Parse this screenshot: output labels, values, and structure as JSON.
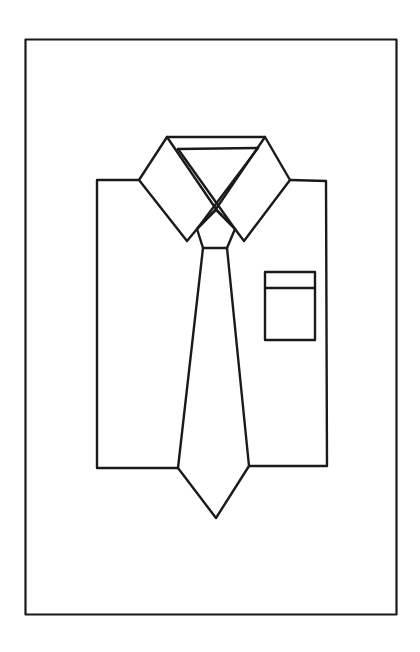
{
  "drawing": {
    "subject": "shirt-and-tie line drawing",
    "stroke_color": "#1a1a1a",
    "background": "#ffffff",
    "frame": {
      "x": 25,
      "y": 39,
      "width": 372,
      "height": 576
    },
    "parts": [
      "frame",
      "shirt-body",
      "collar-left",
      "collar-right",
      "collar-band",
      "tie-knot",
      "tie",
      "pocket"
    ]
  }
}
